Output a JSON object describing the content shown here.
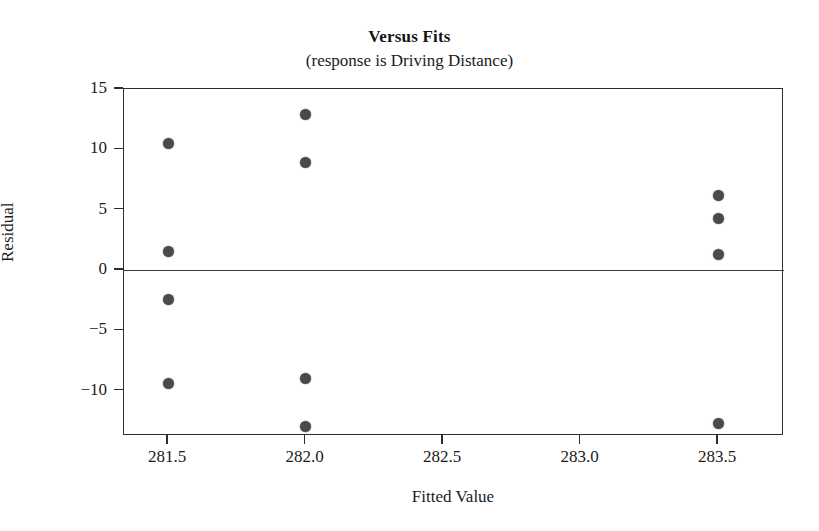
{
  "chart_data": {
    "type": "scatter",
    "title": "Versus Fits",
    "subtitle": "(response is Driving Distance)",
    "xlabel": "Fitted Value",
    "ylabel": "Residual",
    "xlim": [
      281.34,
      283.74
    ],
    "ylim": [
      -13.75,
      15.0
    ],
    "grid": false,
    "legend": null,
    "reference_line": {
      "axis": "y",
      "value": 0
    },
    "xticks": [
      281.5,
      282.0,
      282.5,
      283.0,
      283.5
    ],
    "xticklabels": [
      "281.5",
      "282.0",
      "282.5",
      "283.0",
      "283.5"
    ],
    "yticks": [
      15,
      10,
      5,
      0,
      -5,
      -10
    ],
    "yticklabels": [
      "15",
      "10",
      "5",
      "0",
      "−5",
      "−10"
    ],
    "series": [
      {
        "name": "residuals",
        "marker": "filled-circle",
        "color": "#4a4a4a",
        "x": [
          281.5,
          281.5,
          281.5,
          281.5,
          282.0,
          282.0,
          282.0,
          282.0,
          283.5,
          283.5,
          283.5,
          283.5
        ],
        "y": [
          10.5,
          1.5,
          -2.4,
          -9.4,
          12.9,
          8.9,
          -9.0,
          -13.0,
          6.2,
          4.3,
          1.3,
          -12.7
        ]
      }
    ]
  },
  "axes": {
    "y_title": "Residual",
    "x_title": "Fitted Value"
  }
}
